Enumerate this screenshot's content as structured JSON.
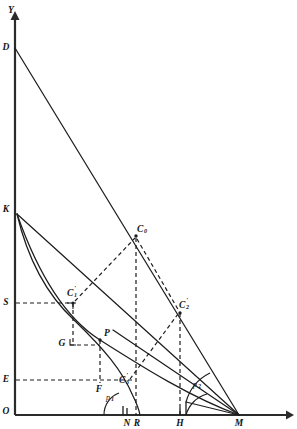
{
  "figure": {
    "background_color": "#ffffff",
    "line_color": "#1d1d1d",
    "axis_color": "#2b2b2b",
    "width": 297,
    "height": 429
  },
  "axes": {
    "y_axis_label": "Y",
    "origin_label": "O",
    "x_axis": {
      "x_start": 15,
      "x_end": 290,
      "y": 415
    },
    "y_axis": {
      "x": 15,
      "y_start": 415,
      "y_end": 14
    }
  },
  "points": [
    {
      "id": "D",
      "label": "D",
      "sub": "",
      "prime": "",
      "x": 15,
      "y": 48,
      "label_x": 6,
      "label_y": 48,
      "dot": false
    },
    {
      "id": "K",
      "label": "K",
      "sub": "",
      "prime": "",
      "x": 15,
      "y": 210,
      "label_x": 6,
      "label_y": 210,
      "dot": false
    },
    {
      "id": "S",
      "label": "S",
      "sub": "",
      "prime": "",
      "x": 15,
      "y": 303,
      "label_x": 6,
      "label_y": 303,
      "dot": false
    },
    {
      "id": "E",
      "label": "E",
      "sub": "",
      "prime": "",
      "x": 15,
      "y": 380,
      "label_x": 6,
      "label_y": 380,
      "dot": false
    },
    {
      "id": "O",
      "label": "O",
      "sub": "",
      "prime": "",
      "x": 15,
      "y": 415,
      "label_x": 6,
      "label_y": 412,
      "dot": false
    },
    {
      "id": "C0",
      "label": "C",
      "sub": "0",
      "prime": "",
      "x": 136,
      "y": 236,
      "label_x": 138,
      "label_y": 231,
      "dot": true
    },
    {
      "id": "C1",
      "label": "C",
      "sub": "1",
      "prime": "'",
      "x": 73,
      "y": 303,
      "label_x": 71,
      "label_y": 295,
      "dot": true
    },
    {
      "id": "C2",
      "label": "C",
      "sub": "2",
      "prime": "'",
      "x": 180,
      "y": 313,
      "label_x": 180,
      "label_y": 307,
      "dot": true
    },
    {
      "id": "C3",
      "label": "C",
      "sub": "3",
      "prime": "'",
      "x": 128,
      "y": 381,
      "label_x": 122,
      "label_y": 381,
      "dot": true
    },
    {
      "id": "P",
      "label": "P",
      "sub": "",
      "prime": "",
      "x": 100,
      "y": 340,
      "label_x": 101,
      "label_y": 335,
      "dot": true
    },
    {
      "id": "G",
      "label": "G",
      "sub": "",
      "prime": "",
      "x": 70,
      "y": 345,
      "label_x": 62,
      "label_y": 344,
      "dot": false
    },
    {
      "id": "F",
      "label": "F",
      "sub": "",
      "prime": "",
      "x": 100,
      "y": 380,
      "label_x": 97,
      "label_y": 389,
      "dot": false
    },
    {
      "id": "N",
      "label": "N",
      "sub": "",
      "prime": "",
      "x": 127,
      "y": 415,
      "label_x": 124,
      "label_y": 423,
      "dot": false
    },
    {
      "id": "R",
      "label": "R",
      "sub": "",
      "prime": "",
      "x": 136,
      "y": 415,
      "label_x": 135,
      "label_y": 423,
      "dot": false
    },
    {
      "id": "H",
      "label": "H",
      "sub": "",
      "prime": "",
      "x": 180,
      "y": 415,
      "label_x": 176,
      "label_y": 423,
      "dot": false
    },
    {
      "id": "M",
      "label": "M",
      "sub": "",
      "prime": "",
      "x": 239,
      "y": 415,
      "label_x": 236,
      "label_y": 423,
      "dot": false
    }
  ],
  "angle_labels": [
    {
      "id": "phi1",
      "letter": "p",
      "sub": "1",
      "x": 109,
      "y": 398
    },
    {
      "id": "phi2",
      "letter": "p",
      "sub": "2",
      "x": 196,
      "y": 385
    }
  ],
  "solid_segments": [
    {
      "name": "segment-D-M",
      "from": "D",
      "to": "M"
    },
    {
      "name": "segment-K-M",
      "from": "K",
      "to": "M"
    },
    {
      "name": "segment-M-C1-ray",
      "from": "M",
      "to": "C1-extended"
    }
  ],
  "dashed_segments": [
    {
      "name": "dash-S-to-C1",
      "from": "S",
      "to": "C1"
    },
    {
      "name": "dash-E-to-C3",
      "from": "E",
      "to": "C3"
    },
    {
      "name": "dash-G-to-P",
      "from": "G",
      "to": "P"
    },
    {
      "name": "dash-C1-to-C0",
      "from": "C1",
      "to": "C0"
    },
    {
      "name": "dash-C0-to-N",
      "from": "C0",
      "to": "N"
    },
    {
      "name": "dash-C0-to-C2",
      "from": "C0",
      "to": "C2"
    },
    {
      "name": "dash-C2-to-H",
      "from": "C2",
      "to": "H"
    },
    {
      "name": "dash-C3-to-C2",
      "from": "C3",
      "to": "C2"
    },
    {
      "name": "dash-P-to-F",
      "from": "P",
      "to": "F"
    },
    {
      "name": "dash-C1-to-below",
      "from": "C1",
      "to": "below"
    }
  ],
  "curves": [
    {
      "name": "curve-K-to-M",
      "description": "concave curve from K through P to M"
    },
    {
      "name": "curve-K-to-C3",
      "description": "inner curve from K descending past C3"
    }
  ],
  "right_angle_marks": [
    {
      "name": "right-angle-at-G",
      "x": 70,
      "y": 345
    },
    {
      "name": "right-angle-at-C1",
      "x": 73,
      "y": 303
    }
  ]
}
